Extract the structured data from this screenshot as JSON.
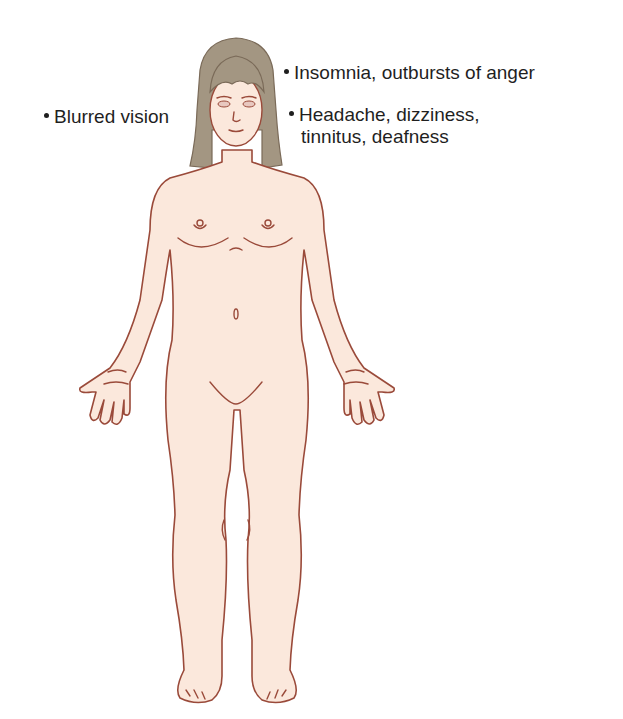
{
  "diagram": {
    "colors": {
      "skin_fill": "#fbe8dc",
      "outline": "#9a4a3a",
      "hair": "#a39682",
      "hair_outline": "#7a6a58",
      "text": "#1f1f1f",
      "background": "#ffffff"
    },
    "labels": [
      {
        "id": "insomnia",
        "text": "Insomnia, outbursts of anger",
        "target": "head"
      },
      {
        "id": "blurred",
        "text": "Blurred vision",
        "target": "eyes"
      },
      {
        "id": "headache",
        "line1": "Headache, dizziness,",
        "line2": "tinnitus, deafness",
        "target": "head/ears"
      }
    ]
  }
}
